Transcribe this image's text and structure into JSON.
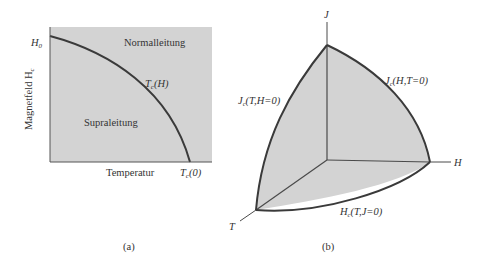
{
  "figure_a": {
    "y_axis_label": "Magnetfeld H",
    "y_axis_label_sub": "c",
    "y_tick_label": "H",
    "y_tick_sub": "0",
    "x_axis_label": "Temperatur",
    "x_tick_label": "T",
    "x_tick_sub": "c",
    "x_tick_arg": "(0)",
    "curve_label": "T",
    "curve_label_sub": "c",
    "curve_label_arg": "(H)",
    "region_normal": "Normalleitung",
    "region_super": "Supraleitung",
    "caption": "(a)"
  },
  "figure_b": {
    "axis_j": "J",
    "axis_h": "H",
    "axis_t": "T",
    "curve_jt_label": "J",
    "curve_jt_sub": "c",
    "curve_jt_arg": "(T,H=0)",
    "curve_jh_label": "J",
    "curve_jh_sub": "c",
    "curve_jh_arg": "(H,T=0)",
    "curve_ht_label": "H",
    "curve_ht_sub": "c",
    "curve_ht_arg": "(T,J=0)",
    "caption": "(b)"
  },
  "colors": {
    "fill": "#d2d2d2",
    "line": "#3a3a3a"
  }
}
